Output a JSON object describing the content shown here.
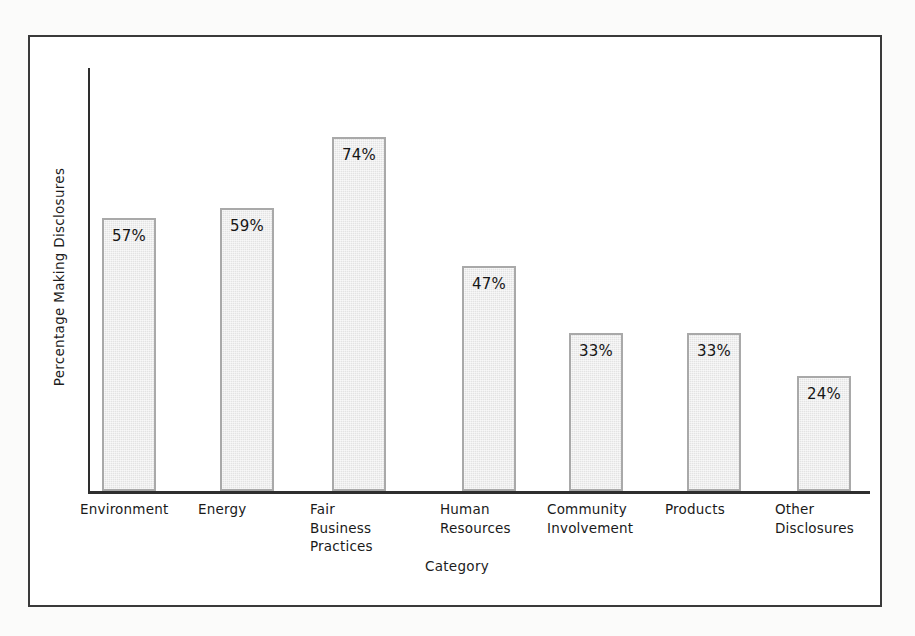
{
  "chart_data": {
    "type": "bar",
    "title": "",
    "xlabel": "Category",
    "ylabel": "Percentage Making Disclosures",
    "ylim": [
      0,
      80
    ],
    "grid": false,
    "legend": null,
    "value_suffix": "%",
    "categories": [
      "Environment",
      "Fair\nBusiness\nPractices",
      "Energy",
      "Human\nResources",
      "Community\nInvolvement",
      "Products",
      "Other\nDisclosures"
    ],
    "bars": [
      {
        "category": "Environment",
        "lines": [
          "Environment"
        ],
        "value": 57,
        "label": "57%"
      },
      {
        "category": "Energy",
        "lines": [
          "Energy"
        ],
        "value": 59,
        "label": "59%"
      },
      {
        "category": "Fair Business Practices",
        "lines": [
          "Fair",
          "Business",
          "Practices"
        ],
        "value": 74,
        "label": "74%"
      },
      {
        "category": "Human Resources",
        "lines": [
          "Human",
          "Resources"
        ],
        "value": 47,
        "label": "47%"
      },
      {
        "category": "Community Involvement",
        "lines": [
          "Community",
          "Involvement"
        ],
        "value": 33,
        "label": "33%"
      },
      {
        "category": "Products",
        "lines": [
          "Products"
        ],
        "value": 33,
        "label": "33%"
      },
      {
        "category": "Other Disclosures",
        "lines": [
          "Other",
          "Disclosures"
        ],
        "value": 24,
        "label": "24%"
      }
    ],
    "values": [
      57,
      59,
      74,
      47,
      33,
      33,
      24
    ],
    "colors": {
      "bar_fill": "#e3e3e3",
      "bar_border": "#a9a9a9",
      "axis": "#2e2e2e",
      "frame": "#3a3a3a",
      "text": "#1a1a1a",
      "background": "#ffffff"
    }
  },
  "layout": {
    "baseline_y": 454,
    "axis_left_x": 58,
    "axis_right_x": 840,
    "px_per_percent": 4.79,
    "bar_width": 54,
    "bar_left_positions": [
      72,
      190,
      302,
      432,
      539,
      657,
      767
    ]
  }
}
